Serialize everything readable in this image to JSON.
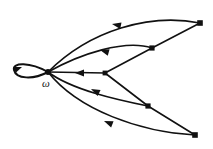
{
  "figure": {
    "kind": "directed-graph",
    "width": 213,
    "height": 149,
    "background_color": "#ffffff",
    "stroke_color": "#111111",
    "omega_label": "ω"
  },
  "nodes": [
    {
      "id": "omega",
      "label": "ω",
      "x": 48,
      "y": 72,
      "radius": 3.0,
      "shape": "dot"
    },
    {
      "id": "mid",
      "label": "",
      "x": 105,
      "y": 73,
      "radius": 2.6,
      "shape": "dot"
    },
    {
      "id": "upper",
      "label": "",
      "x": 152,
      "y": 48,
      "radius": 2.8,
      "shape": "dot"
    },
    {
      "id": "lower",
      "label": "",
      "x": 148,
      "y": 106,
      "radius": 2.8,
      "shape": "dot"
    },
    {
      "id": "topright",
      "label": "",
      "x": 200,
      "y": 23,
      "radius": 3.0,
      "shape": "dot"
    },
    {
      "id": "botright",
      "label": "",
      "x": 195,
      "y": 135,
      "radius": 3.0,
      "shape": "dot"
    }
  ],
  "edges": [
    {
      "id": "loop-omega",
      "from": "omega",
      "to": "omega",
      "style": "self-loop",
      "arrow_at": [
        19,
        70
      ],
      "arrow_angle": 155
    },
    {
      "id": "topright-omega",
      "from": "topright",
      "to": "omega",
      "style": "curve",
      "arrow_at": [
        116,
        24
      ],
      "arrow_angle": 190
    },
    {
      "id": "upper-omega",
      "from": "upper",
      "to": "omega",
      "style": "curve",
      "arrow_at": [
        104,
        50
      ],
      "arrow_angle": 196
    },
    {
      "id": "mid-omega",
      "from": "mid",
      "to": "omega",
      "style": "straight",
      "arrow_at": [
        79,
        73
      ],
      "arrow_angle": 180
    },
    {
      "id": "lower-omega",
      "from": "lower",
      "to": "omega",
      "style": "curve",
      "arrow_at": [
        95,
        90
      ],
      "arrow_angle": 208
    },
    {
      "id": "botright-omega",
      "from": "botright",
      "to": "omega",
      "style": "curve",
      "arrow_at": [
        108,
        122
      ],
      "arrow_angle": 203
    },
    {
      "id": "upper-topright",
      "from": "upper",
      "to": "topright",
      "style": "straight",
      "arrow_at": null,
      "arrow_angle": null
    },
    {
      "id": "mid-upper",
      "from": "mid",
      "to": "upper",
      "style": "straight",
      "arrow_at": null,
      "arrow_angle": null
    },
    {
      "id": "mid-lower",
      "from": "mid",
      "to": "lower",
      "style": "straight",
      "arrow_at": null,
      "arrow_angle": null
    },
    {
      "id": "lower-botright",
      "from": "lower",
      "to": "botright",
      "style": "straight",
      "arrow_at": null,
      "arrow_angle": null
    }
  ]
}
